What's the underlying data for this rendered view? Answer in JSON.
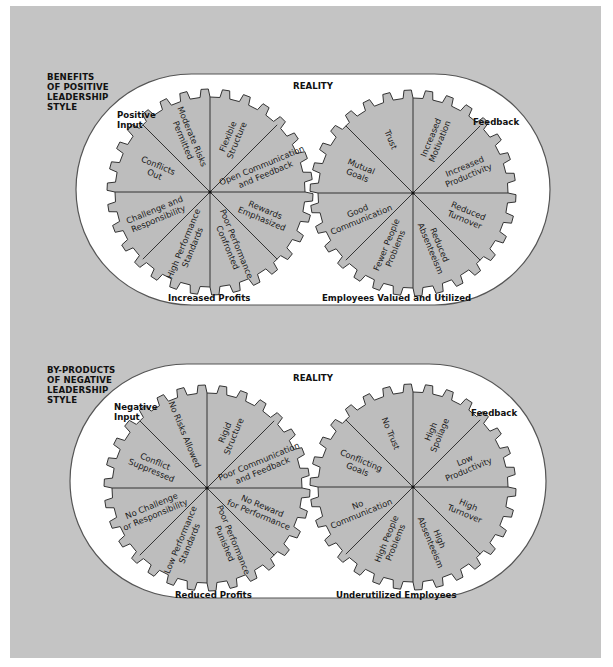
{
  "colors": {
    "background": "#c4c4c4",
    "pill": "#ffffff",
    "gear_fill": "#bdbdbd",
    "outline": "#333333"
  },
  "sections": [
    {
      "heading": [
        "BENEFITS",
        "OF POSITIVE",
        "LEADERSHIP",
        "STYLE"
      ],
      "reality_label": "REALITY",
      "input_label": [
        "Positive",
        "Input"
      ],
      "feedback_label": "Feedback",
      "left_caption": "Increased Profits",
      "right_caption": "Employees Valued and Utilized",
      "left_gear_segments": [
        "Moderate Risks Permitted",
        "Flexible Structure",
        "Open Communication and Feedback",
        "Rewards Emphasized",
        "Poor Performance Confronted",
        "High Performance Standards",
        "Challenge and Responsibility",
        "Conflicts Out"
      ],
      "right_gear_segments": [
        "Trust",
        "Increased Motivation",
        "Increased Productivity",
        "Reduced Turnover",
        "Reduced Absenteeism",
        "Fewer People Problems",
        "Good Communication",
        "Mutual Goals"
      ]
    },
    {
      "heading": [
        "BY-PRODUCTS",
        "OF NEGATIVE",
        "LEADERSHIP",
        "STYLE"
      ],
      "reality_label": "REALITY",
      "input_label": [
        "Negative",
        "Input"
      ],
      "feedback_label": "Feedback",
      "left_caption": "Reduced Profits",
      "right_caption": "Underutilized Employees",
      "left_gear_segments": [
        "No Risks Allowed",
        "Rigid Structure",
        "Poor Communication and Feedback",
        "No Reward for Performance",
        "Poor Performance Punished",
        "Low Performance Standards",
        "No Challenge or Responsibility",
        "Conflict Suppressed"
      ],
      "right_gear_segments": [
        "No Trust",
        "High Spoilage",
        "Low Productivity",
        "High Turnover",
        "High Absenteeism",
        "High People Problems",
        "No Communication",
        "Conflicting Goals"
      ]
    }
  ]
}
